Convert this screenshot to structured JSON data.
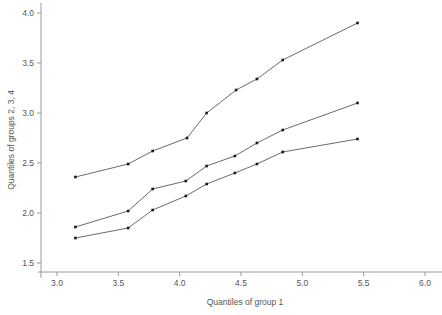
{
  "chart_data": {
    "type": "line",
    "title": "",
    "subtitle": "",
    "xlabel": "Quantiles of group 1",
    "ylabel": "Quantiles of groups 2, 3, 4",
    "xlim": [
      2.85,
      6.15
    ],
    "ylim": [
      1.44,
      4.06
    ],
    "xticks": [
      3.0,
      3.5,
      4.0,
      4.5,
      5.0,
      5.5,
      6.0
    ],
    "xtick_labels": [
      "3.0",
      "3.5",
      "4.0",
      "4.5",
      "5.0",
      "5.5",
      "6.0"
    ],
    "yticks": [
      1.5,
      2.0,
      2.5,
      3.0,
      3.5,
      4.0
    ],
    "ytick_labels": [
      "1.5",
      "2.0",
      "2.5",
      "3.0",
      "3.5",
      "4.0"
    ],
    "grid": false,
    "legend": "none",
    "marker": "square",
    "series": [
      {
        "name": "group 2",
        "x": [
          3.15,
          3.58,
          3.78,
          4.06,
          4.22,
          4.46,
          4.63,
          4.84,
          5.45
        ],
        "y": [
          2.36,
          2.49,
          2.62,
          2.75,
          3.0,
          3.23,
          3.34,
          3.53,
          3.9
        ]
      },
      {
        "name": "group 3",
        "x": [
          3.15,
          3.58,
          3.78,
          4.05,
          4.22,
          4.45,
          4.63,
          4.84,
          5.45
        ],
        "y": [
          1.86,
          2.02,
          2.24,
          2.32,
          2.47,
          2.57,
          2.7,
          2.83,
          3.1
        ]
      },
      {
        "name": "group 4",
        "x": [
          3.15,
          3.58,
          3.78,
          4.05,
          4.22,
          4.45,
          4.63,
          4.84,
          5.45
        ],
        "y": [
          1.75,
          1.85,
          2.03,
          2.17,
          2.29,
          2.4,
          2.49,
          2.61,
          2.74
        ]
      }
    ]
  },
  "colors": {
    "line": "#444444",
    "marker": "#1a1a1a",
    "axis": "#9a9a9a",
    "text": "#555555",
    "background": "#ffffff"
  }
}
